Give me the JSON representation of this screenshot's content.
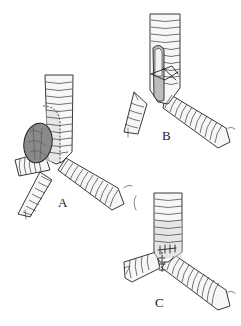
{
  "figure": {
    "background": "#ffffff",
    "ink_color": "#222222",
    "panels": [
      {
        "id": "A",
        "label": "A",
        "content": "Trachea bifurcation with tumor on right main bronchus; dashed resection line around tumor base",
        "label_position": {
          "x": 60,
          "y": 198
        }
      },
      {
        "id": "B",
        "label": "B",
        "content": "Trachea after resection showing opened defect with crossing sutures; separated distal bronchus segment",
        "label_position": {
          "x": 163,
          "y": 131
        }
      },
      {
        "id": "C",
        "label": "C",
        "content": "Completed anastomosis at carina with interrupted sutures",
        "label_position": {
          "x": 156,
          "y": 298
        }
      }
    ]
  }
}
